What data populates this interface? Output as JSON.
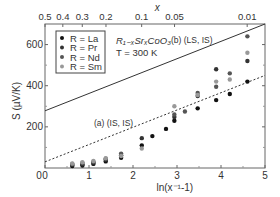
{
  "chart_data": {
    "type": "scatter",
    "title": "",
    "xlabel": "ln(x⁻¹-1)",
    "ylabel": "S (µV/K)",
    "top_xlabel": "x",
    "xlim": [
      0,
      5
    ],
    "ylim": [
      0,
      700
    ],
    "x_ticks": [
      0,
      1,
      2,
      3,
      4,
      5
    ],
    "y_ticks": [
      200,
      400,
      600
    ],
    "y_tick_labels": [
      "200",
      "400",
      "600"
    ],
    "x_tick_labels": [
      "0",
      "1",
      "2",
      "3",
      "4",
      "5"
    ],
    "top_ticks": [
      {
        "label": "0.5",
        "pos": 0.0
      },
      {
        "label": "0.4",
        "pos": 0.405
      },
      {
        "label": "0.3",
        "pos": 0.847
      },
      {
        "label": "0.2",
        "pos": 1.386
      },
      {
        "label": "0.1",
        "pos": 2.197
      },
      {
        "label": "0.05",
        "pos": 2.944
      },
      {
        "label": "0.01",
        "pos": 4.595
      }
    ],
    "annotations": [
      {
        "text": "R₁₋ₓSrₓCoO₃",
        "id": "formula"
      },
      {
        "text": "T = 300 K",
        "id": "temperature"
      },
      {
        "text": "(b) (LS, IS)",
        "id": "line_b"
      },
      {
        "text": "(a) (IS, IS)",
        "id": "line_a"
      }
    ],
    "lines": [
      {
        "name": "(b) (LS, IS)",
        "style": "solid",
        "x": [
          0,
          5
        ],
        "y": [
          278,
          700
        ]
      },
      {
        "name": "(a) (IS, IS)",
        "style": "dashed",
        "x": [
          0,
          5
        ],
        "y": [
          30,
          450
        ]
      }
    ],
    "legend_position": "upper left",
    "series": [
      {
        "name": "R = La",
        "color": "#111111",
        "points": [
          [
            0.62,
            10
          ],
          [
            0.85,
            12
          ],
          [
            1.1,
            20
          ],
          [
            1.38,
            32
          ],
          [
            1.73,
            50
          ],
          [
            2.2,
            110
          ],
          [
            2.44,
            155
          ],
          [
            2.75,
            190
          ],
          [
            2.94,
            230
          ],
          [
            3.47,
            290
          ],
          [
            3.89,
            330
          ],
          [
            4.2,
            360
          ],
          [
            4.6,
            420
          ]
        ]
      },
      {
        "name": "R = Pr",
        "color": "#333333",
        "points": [
          [
            0.62,
            15
          ],
          [
            0.85,
            18
          ],
          [
            1.1,
            26
          ],
          [
            1.38,
            40
          ],
          [
            1.73,
            62
          ],
          [
            2.2,
            145
          ],
          [
            2.94,
            248
          ],
          [
            3.47,
            350
          ],
          [
            3.89,
            480
          ],
          [
            4.6,
            520
          ]
        ]
      },
      {
        "name": "R = Nd",
        "color": "#555555",
        "points": [
          [
            0.62,
            20
          ],
          [
            0.85,
            25
          ],
          [
            1.1,
            30
          ],
          [
            1.38,
            45
          ],
          [
            1.73,
            70
          ],
          [
            2.94,
            260
          ],
          [
            3.18,
            275
          ],
          [
            3.47,
            365
          ],
          [
            3.89,
            395
          ],
          [
            4.2,
            460
          ],
          [
            4.6,
            640
          ]
        ]
      },
      {
        "name": "R = Sm",
        "color": "#999999",
        "points": [
          [
            0.62,
            22
          ],
          [
            0.85,
            28
          ],
          [
            1.1,
            34
          ],
          [
            1.38,
            48
          ],
          [
            1.73,
            58
          ],
          [
            2.2,
            95
          ],
          [
            2.94,
            300
          ],
          [
            3.47,
            355
          ],
          [
            3.89,
            420
          ],
          [
            4.2,
            430
          ],
          [
            4.6,
            560
          ]
        ]
      }
    ]
  }
}
